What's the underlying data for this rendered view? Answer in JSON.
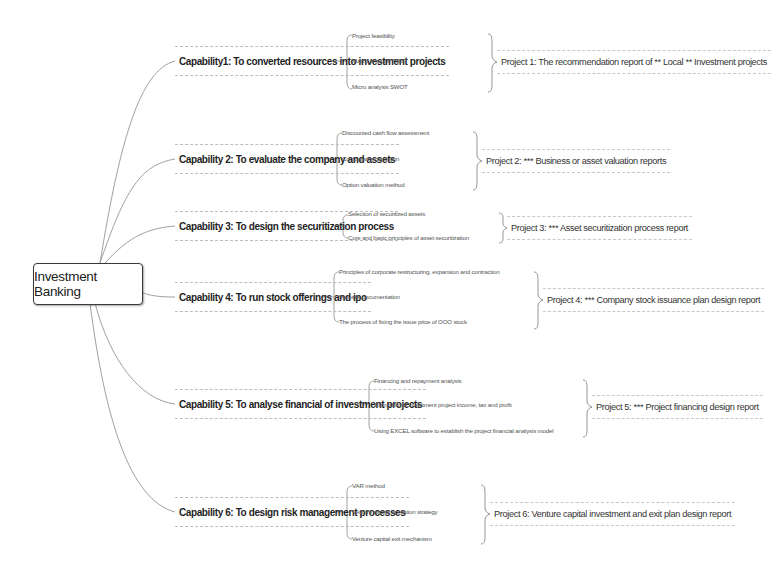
{
  "root": {
    "label": "Investment Banking"
  },
  "capabilities": [
    {
      "label": "Capability1:  To converted resources into investment projects",
      "subs": [
        "Project feasibility",
        "Macro analysis PEST",
        "Micro analysis SWOT"
      ],
      "project": "Project 1: The recommendation report of ** Local ** Investment projects"
    },
    {
      "label": "Capability 2: To evaluate the company and assets",
      "subs": [
        "Discounted cash flow assessment",
        "Comparative valuation",
        "Option valuation method"
      ],
      "project": "Project 2: *** Business or asset valuation reports"
    },
    {
      "label": "Capability 3: To design the securitization process",
      "subs": [
        "Selection of securitized assets",
        "Core and basic principles of asset securitization"
      ],
      "project": "Project 3: *** Asset securitization process report"
    },
    {
      "label": "Capability 4: To run stock offerings and ipo",
      "subs": [
        "Principles of corporate restructuring, expansion and contraction",
        "Release documentation",
        "The process of fixing the issue price of OOO stock"
      ],
      "project": "Project 4: *** Company stock issuance plan design report"
    },
    {
      "label": "Capability 5: To analyse financial of investment projects",
      "subs": [
        "Financing and repayment analysis",
        "Estimating of investment project income, tax and profit",
        "Using EXCEL software to establish the project financial analysis model"
      ],
      "project": "Project 5: *** Project financing design report"
    },
    {
      "label": "Capability 6: To design risk management processes",
      "subs": [
        "VAR method",
        "Venture capital operation strategy",
        "Venture capital exit mechanism"
      ],
      "project": "Project 6: Venture capital investment and exit plan design report"
    }
  ],
  "colors": {
    "connector": "#9a9a9a",
    "node_border": "#3a3a3a",
    "dashed_border": "#bdbdbd",
    "text": "#222222"
  }
}
